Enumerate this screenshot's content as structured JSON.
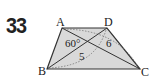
{
  "problem": {
    "number": "33"
  },
  "figure": {
    "shape": "trapezoid",
    "fill_color": "#d9d9d9",
    "stroke_color": "#333333",
    "vertices": {
      "A": {
        "label": "A"
      },
      "B": {
        "label": "B"
      },
      "C": {
        "label": "C"
      },
      "D": {
        "label": "D"
      }
    },
    "annotations": {
      "angle": "60°",
      "diagonal_BD_length": "5",
      "diagonal_AC_length": "6"
    }
  }
}
